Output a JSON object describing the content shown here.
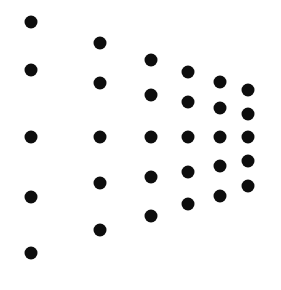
{
  "diagram": {
    "background": "#ffffff",
    "dot_color": "#0d0d0d",
    "dot_radius": 6.5,
    "columns": [
      {
        "x": 31,
        "ys": [
          22,
          70,
          137,
          197,
          253
        ]
      },
      {
        "x": 100,
        "ys": [
          43,
          83,
          137,
          183,
          230
        ]
      },
      {
        "x": 151,
        "ys": [
          60,
          95,
          137,
          177,
          216
        ]
      },
      {
        "x": 188,
        "ys": [
          72,
          102,
          137,
          172,
          204
        ]
      },
      {
        "x": 220,
        "ys": [
          82,
          108,
          137,
          166,
          196
        ]
      },
      {
        "x": 248,
        "ys": [
          90,
          114,
          137,
          161,
          186
        ]
      }
    ]
  }
}
